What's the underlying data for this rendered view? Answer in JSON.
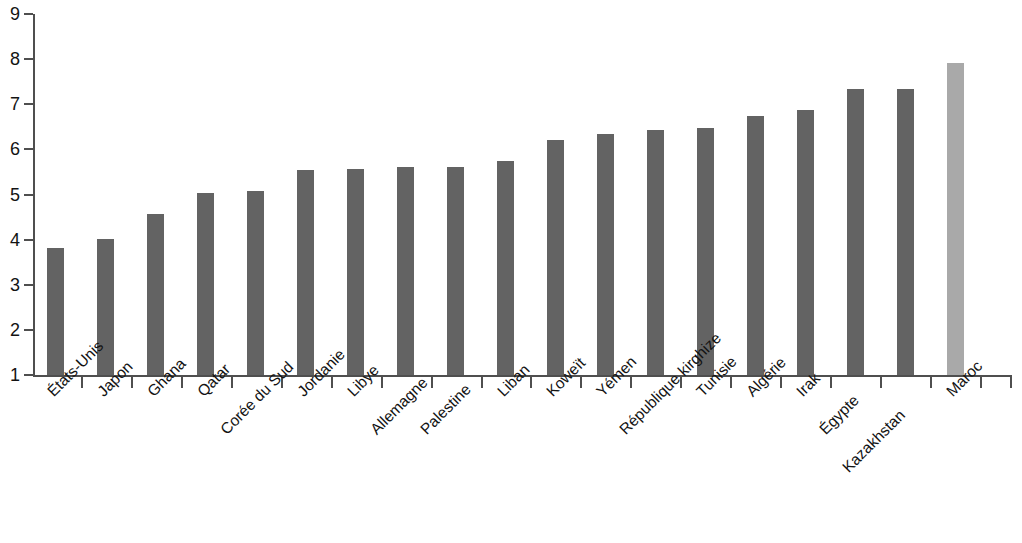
{
  "chart_data": {
    "type": "bar",
    "title": "",
    "subtitle": "",
    "xlabel": "",
    "ylabel": "",
    "ylim": [
      1,
      9
    ],
    "y_ticks": [
      1,
      2,
      3,
      4,
      5,
      6,
      7,
      8,
      9
    ],
    "grid": false,
    "legend": "none",
    "categories": [
      "États-Unis",
      "Japon",
      "Ghana",
      "Qatar",
      "Corée du Sud",
      "Jordanie",
      "Libye",
      "Allemagne",
      "Palestine",
      "Liban",
      "Koweït",
      "Yémen",
      "République kirghize",
      "Tunisie",
      "Algérie",
      "Irak",
      "Égypte",
      "Kazakhstan",
      "Maroc"
    ],
    "values": [
      3.82,
      4.02,
      4.57,
      5.04,
      5.07,
      5.55,
      5.57,
      5.6,
      5.62,
      5.74,
      6.2,
      6.33,
      6.44,
      6.47,
      6.73,
      6.88,
      7.34,
      7.34,
      7.92
    ],
    "bar_color": "#636363",
    "highlight_color": "#a9a9a9",
    "highlight_index": 18,
    "label_rotation_deg": -45,
    "label_offset_rows": [
      0,
      0,
      0,
      0,
      1,
      0,
      0,
      1,
      1,
      0,
      0,
      0,
      1,
      0,
      0,
      0,
      1,
      2,
      0
    ]
  }
}
